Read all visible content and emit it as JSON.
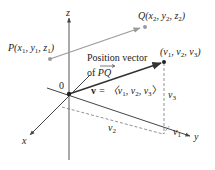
{
  "diagram": {
    "axes": {
      "x_label": "x",
      "y_label": "y",
      "z_label": "z",
      "origin_label": "0"
    },
    "points": {
      "P": {
        "name": "P",
        "coords": "(x",
        "label_parts": [
          "P(x",
          "1",
          ", y",
          "1",
          ", z",
          "1",
          ")"
        ]
      },
      "Q": {
        "name": "Q",
        "label_parts": [
          "Q(x",
          "2",
          ", y",
          "2",
          ", z",
          "2",
          ")"
        ]
      },
      "V": {
        "label_parts": [
          "(v",
          "1",
          ", v",
          "2",
          ", v",
          "3",
          ")"
        ]
      }
    },
    "annotations": {
      "position_vector_line1": "Position vector",
      "position_vector_line2_prefix": "of ",
      "position_vector_line2_vec": "PQ",
      "vector_eq_bold": "v",
      "vector_eq_rest_parts": [
        " = 〈v",
        "1",
        ", v",
        "2",
        ", v",
        "3",
        "〉"
      ],
      "v1_parts": [
        "v",
        "1"
      ],
      "v2_parts": [
        "v",
        "2"
      ],
      "v3_parts": [
        "v",
        "3"
      ]
    },
    "colors": {
      "axis": "#555555",
      "vector_pq": "#9a9a9a",
      "position_vector": "#333333",
      "dashed": "#777777"
    }
  }
}
